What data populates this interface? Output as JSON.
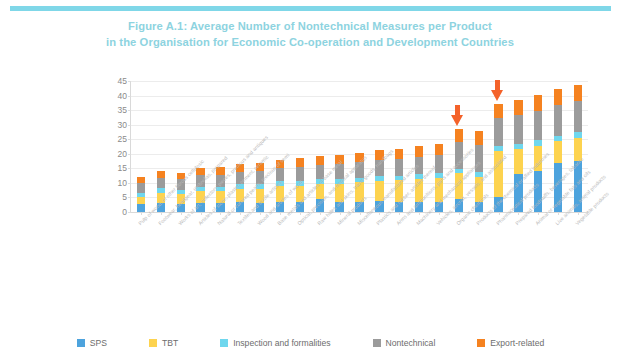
{
  "top_band": {
    "color": "#7fd7e8"
  },
  "title": {
    "line1": "Figure A.1: Average Number of Nontechnical Measures per Product",
    "line2": "in the Organisation for Economic Co-operation and Development Countries",
    "color": "#8dd3e0"
  },
  "legend": {
    "items": [
      {
        "label": "SPS",
        "color": "#4da3dd"
      },
      {
        "label": "TBT",
        "color": "#fdd34f"
      },
      {
        "label": "Inspection and formalities",
        "color": "#6fd7ee"
      },
      {
        "label": "Nontechnical",
        "color": "#9b9b9b"
      },
      {
        "label": "Export-related",
        "color": "#f58220"
      }
    ]
  },
  "annotations": [
    {
      "name": "arrow-pharmaceutical-products",
      "target_category": "Organic chemicals",
      "color": "#f4622a"
    },
    {
      "name": "arrow-prepared-foodstuffs",
      "target_category": "Pharmaceutical products",
      "color": "#f4622a"
    }
  ],
  "chart_data": {
    "type": "bar",
    "stacked": true,
    "title": "Figure A.1: Average Number of Nontechnical Measures per Product in the Organisation for Economic Co-operation and Development Countries",
    "xlabel": "",
    "ylabel": "",
    "ylim": [
      0,
      45
    ],
    "yticks": [
      0,
      5,
      10,
      15,
      20,
      25,
      30,
      35,
      40,
      45
    ],
    "grid": true,
    "legend_position": "bottom",
    "categories": [
      "Pulp of wood, of other fibrous cellulosic",
      "Footwear, headgear, umbrellas, prepared",
      "Works of art, collectors' pieces, precious and antiques",
      "Articles of stone, plaster, cement, ceramic",
      "Natural or cultured pearls, precious of semi",
      "Textiles and textile articles",
      "Wood and articles of wood",
      "Base metals and articles of base metal",
      "Optical, precision, and medical apparatus",
      "Raw hides and skins, travel goods, handbags",
      "Mineral products",
      "Miscellaneous manufactured articles",
      "Plastics and rubber, articles thereof",
      "Arms and ammunitions, parts and accessories",
      "Machinery and mechanical appliances",
      "Vehicles, aircraft, vessels, and associated",
      "Organic chemicals",
      "Products of the chemical or allied industries",
      "Pharmaceutical products",
      "Prepared foodstuffs, beverages, tobacco",
      "Animal or vegetable fats and oils",
      "Live animals, animal products",
      "Vegetable products"
    ],
    "series": [
      {
        "name": "SPS",
        "color": "#4da3dd",
        "values": [
          2.6,
          3.2,
          2.8,
          3.0,
          3.1,
          3.4,
          3.2,
          3.6,
          3.5,
          4.6,
          3.4,
          3.6,
          3.8,
          3.3,
          3.6,
          3.5,
          4.3,
          3.6,
          5.0,
          13.0,
          14.0,
          17.0,
          17.6
        ]
      },
      {
        "name": "TBT",
        "color": "#fdd34f",
        "values": [
          2.6,
          3.5,
          3.3,
          4.2,
          4.0,
          4.6,
          4.8,
          5.4,
          5.6,
          5.2,
          6.2,
          6.6,
          7.0,
          7.6,
          7.8,
          8.2,
          9.0,
          8.4,
          16.0,
          8.6,
          8.8,
          7.4,
          8.0
        ]
      },
      {
        "name": "Inspection and formalities",
        "color": "#6fd7ee",
        "values": [
          1.5,
          1.4,
          1.4,
          1.5,
          1.5,
          1.5,
          1.5,
          1.5,
          1.6,
          1.6,
          1.6,
          1.6,
          1.6,
          1.6,
          1.6,
          1.6,
          1.5,
          1.6,
          1.6,
          1.8,
          1.8,
          1.8,
          1.8
        ]
      },
      {
        "name": "Nontechnical",
        "color": "#9b9b9b",
        "values": [
          3.3,
          3.6,
          3.7,
          4.0,
          4.2,
          4.3,
          4.5,
          4.6,
          4.8,
          4.6,
          5.2,
          5.4,
          5.6,
          5.8,
          6.0,
          6.2,
          9.2,
          9.4,
          9.6,
          10.0,
          10.2,
          10.4,
          10.6
        ]
      },
      {
        "name": "Export-related",
        "color": "#f58220",
        "values": [
          2.0,
          2.3,
          2.3,
          2.5,
          2.6,
          2.6,
          2.8,
          2.8,
          3.0,
          3.2,
          3.2,
          3.2,
          3.4,
          3.4,
          3.6,
          3.8,
          4.6,
          4.8,
          5.0,
          5.2,
          5.4,
          5.6,
          5.8
        ]
      }
    ],
    "totals": [
      12.0,
      14.0,
      13.5,
      15.2,
      15.4,
      16.4,
      16.8,
      17.9,
      18.5,
      19.2,
      19.6,
      20.4,
      21.4,
      21.7,
      22.6,
      23.3,
      28.6,
      27.8,
      37.2,
      38.6,
      40.2,
      42.2,
      43.8
    ]
  }
}
